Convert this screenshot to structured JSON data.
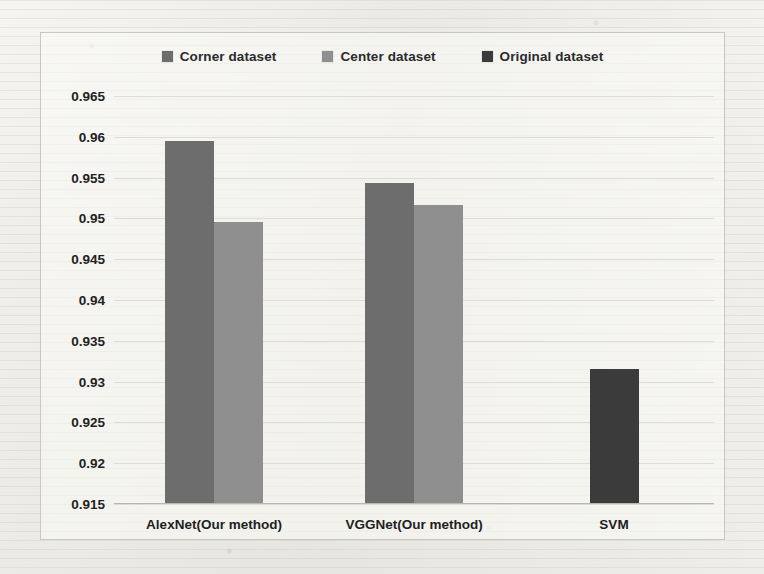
{
  "chart_data": {
    "type": "bar",
    "title": "",
    "xlabel": "",
    "ylabel": "",
    "categories": [
      "AlexNet(Our method)",
      "VGGNet(Our method)",
      "SVM"
    ],
    "series": [
      {
        "name": "Corner dataset",
        "color": "#6d6d6d",
        "values": [
          0.9595,
          0.9543,
          null
        ]
      },
      {
        "name": "Center dataset",
        "color": "#8f8f8f",
        "values": [
          0.9495,
          0.9516,
          null
        ]
      },
      {
        "name": "Original dataset",
        "color": "#3b3b3b",
        "values": [
          null,
          null,
          0.9315
        ]
      }
    ],
    "ylim": [
      0.915,
      0.965
    ],
    "ytick_step": 0.005,
    "yticks": [
      "0.965",
      "0.96",
      "0.955",
      "0.95",
      "0.945",
      "0.94",
      "0.935",
      "0.93",
      "0.925",
      "0.92",
      "0.915"
    ],
    "ytick_values": [
      0.965,
      0.96,
      0.955,
      0.95,
      0.945,
      0.94,
      0.935,
      0.93,
      0.925,
      0.92,
      0.915
    ],
    "grid": true,
    "legend_position": "top-center"
  },
  "legend": {
    "items": [
      {
        "label": "Corner dataset",
        "color": "#6d6d6d"
      },
      {
        "label": "Center dataset",
        "color": "#8f8f8f"
      },
      {
        "label": "Original dataset",
        "color": "#3b3b3b"
      }
    ]
  }
}
